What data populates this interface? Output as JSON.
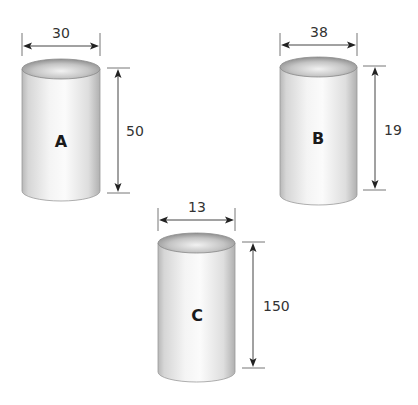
{
  "diagram": {
    "type": "cylinder-dimensions",
    "cylinders": [
      {
        "label": "A",
        "diameter": "30",
        "height": "50"
      },
      {
        "label": "B",
        "diameter": "38",
        "height": "19"
      },
      {
        "label": "C",
        "diameter": "13",
        "height": "150"
      }
    ]
  }
}
